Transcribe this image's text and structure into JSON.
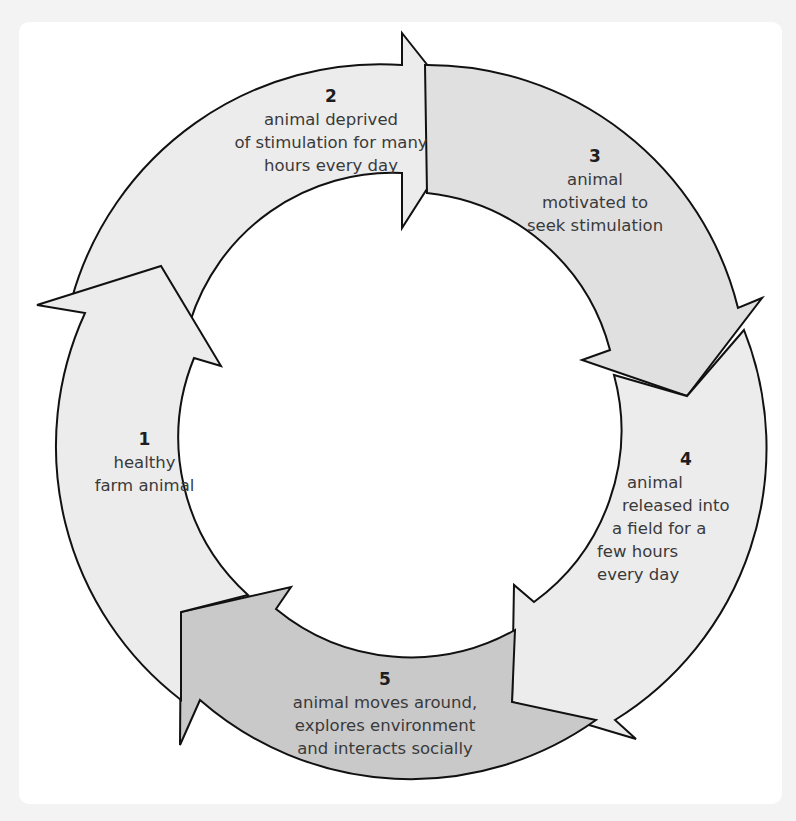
{
  "diagram": {
    "type": "cycle",
    "colors": {
      "background": "#f3f3f3",
      "panel": "#ffffff",
      "arrow_light": "#ececec",
      "arrow_mid": "#e0e0e0",
      "arrow_dark": "#c9c9c9",
      "stroke": "#111111",
      "text": "#3a3a3a"
    },
    "steps": [
      {
        "number": "1",
        "lines": [
          "healthy",
          "farm animal"
        ]
      },
      {
        "number": "2",
        "lines": [
          "animal deprived",
          "of stimulation for many",
          "hours every day"
        ]
      },
      {
        "number": "3",
        "lines": [
          "animal",
          "motivated to",
          "seek stimulation"
        ]
      },
      {
        "number": "4",
        "lines": [
          "animal",
          "released into",
          "a field for a",
          "few hours",
          "every day"
        ]
      },
      {
        "number": "5",
        "lines": [
          "animal moves around,",
          "explores environment",
          "and interacts socially"
        ]
      }
    ]
  }
}
